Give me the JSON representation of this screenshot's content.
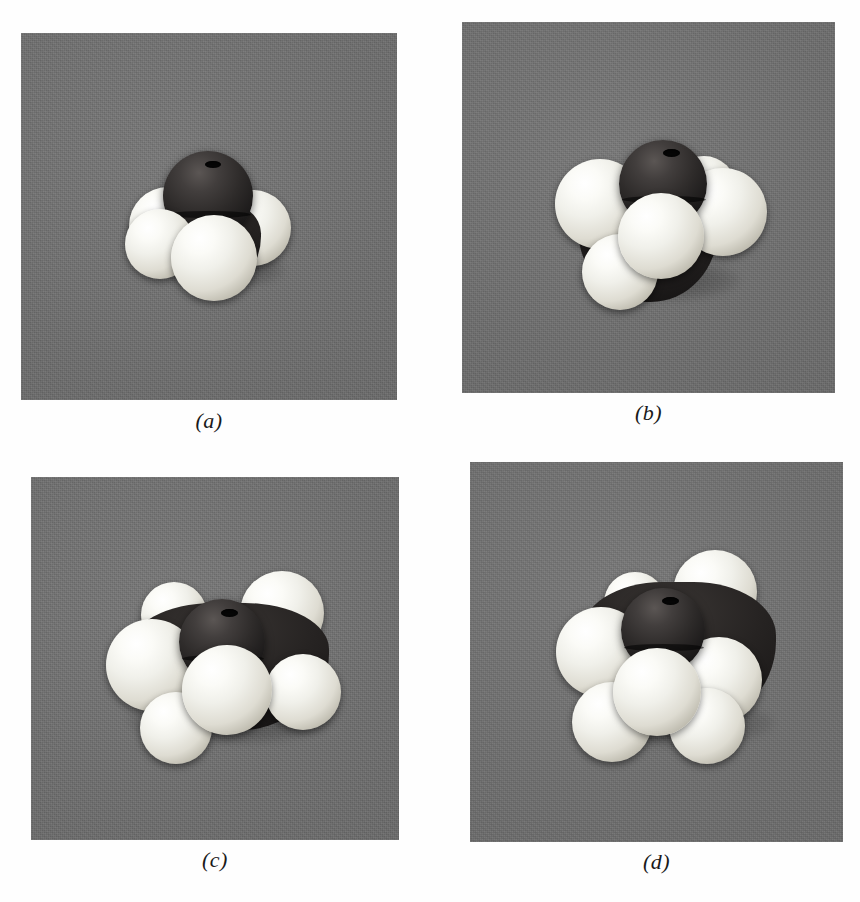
{
  "figure": {
    "kind": "space-filling molecular models",
    "background_color": "#ffffff",
    "photo_background_color": "#6e6e6e",
    "carbon_color": "#1d1b1b",
    "hydrogen_color": "#f0f0ea"
  },
  "panels": [
    {
      "id": "a",
      "caption": "(a)",
      "molecule_name": "methane",
      "formula": "CH4",
      "carbon_count": 1,
      "hydrogen_count": 4,
      "photo": {
        "x": 21,
        "y": 33,
        "w": 376,
        "h": 367
      },
      "caption_box": {
        "x": 21,
        "y": 404,
        "w": 376
      },
      "atoms": [
        {
          "element": "C",
          "cx": 208,
          "cy": 196,
          "r": 45,
          "z": 3,
          "bore": true
        },
        {
          "element": "H",
          "cx": 168,
          "cy": 226,
          "r": 39,
          "z": 2
        },
        {
          "element": "H",
          "cx": 253,
          "cy": 228,
          "r": 38,
          "z": 1
        },
        {
          "element": "H",
          "cx": 214,
          "cy": 246,
          "r": 43,
          "z": 4
        }
      ]
    },
    {
      "id": "b",
      "caption": "(b)",
      "molecule_name": "ethane",
      "formula": "C2H6",
      "carbon_count": 2,
      "hydrogen_count": 6,
      "photo": {
        "x": 462,
        "y": 22,
        "w": 373,
        "h": 371
      },
      "caption_box": {
        "x": 462,
        "y": 397,
        "w": 373
      },
      "atoms": [
        {
          "element": "C",
          "cx": 663,
          "cy": 184,
          "r": 44,
          "z": 3,
          "bore": true
        },
        {
          "element": "H",
          "cx": 600,
          "cy": 204,
          "r": 45,
          "z": 2
        },
        {
          "element": "H",
          "cx": 723,
          "cy": 212,
          "r": 44,
          "z": 2
        },
        {
          "element": "H",
          "cx": 661,
          "cy": 236,
          "r": 43,
          "z": 4
        },
        {
          "element": "H",
          "cx": 620,
          "cy": 272,
          "r": 38,
          "z": 1
        },
        {
          "element": "H",
          "cx": 703,
          "cy": 184,
          "r": 32,
          "z": 1
        }
      ]
    },
    {
      "id": "c",
      "caption": "(c)",
      "molecule_name": "propane",
      "formula": "C3H8",
      "carbon_count": 3,
      "hydrogen_count": 8,
      "photo": {
        "x": 31,
        "y": 477,
        "w": 368,
        "h": 363
      },
      "caption_box": {
        "x": 31,
        "y": 845,
        "w": 368
      },
      "atoms": [
        {
          "element": "C",
          "cx": 222,
          "cy": 640,
          "r": 43,
          "z": 3,
          "bore": true
        },
        {
          "element": "H",
          "cx": 154,
          "cy": 665,
          "r": 46,
          "z": 2
        },
        {
          "element": "H",
          "cx": 283,
          "cy": 690,
          "r": 45,
          "z": 4
        },
        {
          "element": "H",
          "cx": 168,
          "cy": 616,
          "r": 33,
          "z": 1
        },
        {
          "element": "H",
          "cx": 282,
          "cy": 620,
          "r": 42,
          "z": 2
        },
        {
          "element": "H",
          "cx": 303,
          "cy": 692,
          "r": 38,
          "z": 3
        },
        {
          "element": "H",
          "cx": 176,
          "cy": 728,
          "r": 36,
          "z": 1
        }
      ]
    },
    {
      "id": "d",
      "caption": "(d)",
      "molecule_name": "butane",
      "formula": "C4H10",
      "carbon_count": 4,
      "hydrogen_count": 10,
      "photo": {
        "x": 470,
        "y": 462,
        "w": 373,
        "h": 380
      },
      "caption_box": {
        "x": 470,
        "y": 846,
        "w": 373
      },
      "atoms": [
        {
          "element": "C",
          "cx": 663,
          "cy": 630,
          "r": 42,
          "z": 4,
          "bore": true
        },
        {
          "element": "H",
          "cx": 601,
          "cy": 654,
          "r": 45,
          "z": 3
        },
        {
          "element": "H",
          "cx": 720,
          "cy": 636,
          "r": 31,
          "z": 2
        },
        {
          "element": "H",
          "cx": 657,
          "cy": 692,
          "r": 44,
          "z": 5
        },
        {
          "element": "H",
          "cx": 719,
          "cy": 680,
          "r": 43,
          "z": 3
        },
        {
          "element": "H",
          "cx": 612,
          "cy": 722,
          "r": 40,
          "z": 2
        },
        {
          "element": "H",
          "cx": 707,
          "cy": 726,
          "r": 38,
          "z": 2
        },
        {
          "element": "H",
          "cx": 636,
          "cy": 600,
          "r": 32,
          "z": 1
        }
      ]
    }
  ]
}
